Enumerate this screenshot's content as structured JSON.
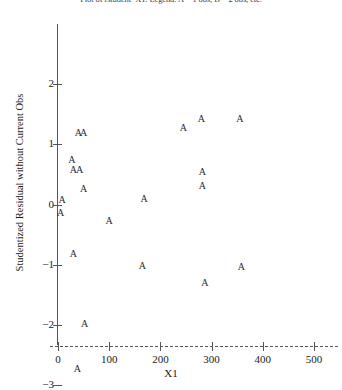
{
  "chart_data": {
    "type": "scatter",
    "title": "Plot of rstudent*X1.  Legend: A = 1 obs, B = 2 obs, etc.",
    "xlabel": "X1",
    "ylabel": "Studentized Residual without Current Obs",
    "marker_symbol": "A",
    "grid": false,
    "legend": null,
    "xlim": [
      -30,
      545
    ],
    "ylim": [
      -3.25,
      2.1
    ],
    "xticks": [
      0,
      100,
      200,
      300,
      400,
      500
    ],
    "xtick_labels": [
      "0",
      "100",
      "200",
      "300",
      "400",
      "500"
    ],
    "yticks": [
      2,
      1,
      0,
      -1,
      -2,
      -3
    ],
    "ytick_labels": [
      "2",
      "1",
      "0",
      "−1",
      "−2",
      "−3"
    ],
    "n_points": 21,
    "points": [
      {
        "x": 8,
        "y": 0.08,
        "label": "A"
      },
      {
        "x": 5,
        "y": -0.14,
        "label": "A"
      },
      {
        "x": 27,
        "y": 0.73,
        "label": "A"
      },
      {
        "x": 30,
        "y": 0.57,
        "label": "A"
      },
      {
        "x": 42,
        "y": 0.57,
        "label": "A"
      },
      {
        "x": 40,
        "y": 1.18,
        "label": "A"
      },
      {
        "x": 50,
        "y": 1.18,
        "label": "A"
      },
      {
        "x": 50,
        "y": 0.26,
        "label": "A"
      },
      {
        "x": 30,
        "y": -0.82,
        "label": "A"
      },
      {
        "x": 52,
        "y": -1.98,
        "label": "A"
      },
      {
        "x": 38,
        "y": -2.73,
        "label": "A"
      },
      {
        "x": 100,
        "y": -0.28,
        "label": "A"
      },
      {
        "x": 168,
        "y": 0.09,
        "label": "A"
      },
      {
        "x": 165,
        "y": -1.02,
        "label": "A"
      },
      {
        "x": 245,
        "y": 1.27,
        "label": "A"
      },
      {
        "x": 280,
        "y": 1.42,
        "label": "A"
      },
      {
        "x": 282,
        "y": 0.54,
        "label": "A"
      },
      {
        "x": 282,
        "y": 0.3,
        "label": "A"
      },
      {
        "x": 287,
        "y": -1.3,
        "label": "A"
      },
      {
        "x": 358,
        "y": -1.03,
        "label": "A"
      },
      {
        "x": 355,
        "y": 1.42,
        "label": "A"
      }
    ]
  }
}
